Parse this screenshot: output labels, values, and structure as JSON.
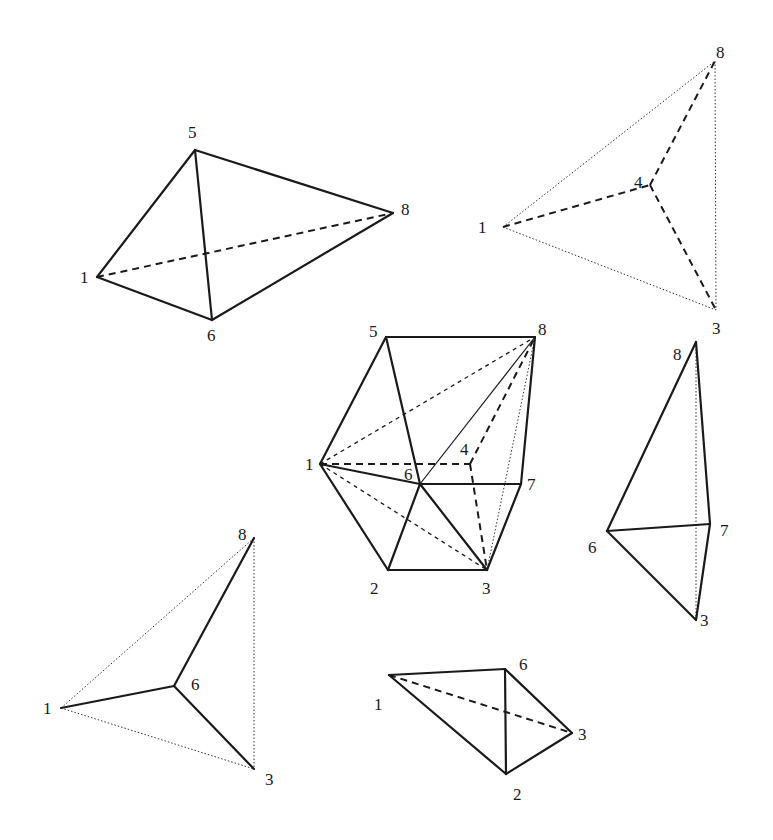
{
  "diagram": {
    "figures": [
      {
        "id": "tetra-1-5-6-8",
        "vertices": {
          "1": [
            97,
            277
          ],
          "5": [
            195,
            150
          ],
          "8": [
            393,
            213
          ],
          "6": [
            212,
            320
          ]
        },
        "labels": {
          "1": [
            80,
            283
          ],
          "5": [
            188,
            138
          ],
          "8": [
            401,
            215
          ],
          "6": [
            207,
            341
          ]
        },
        "solid": [
          [
            "1",
            "5"
          ],
          [
            "5",
            "8"
          ],
          [
            "8",
            "6"
          ],
          [
            "6",
            "1"
          ],
          [
            "5",
            "6"
          ]
        ],
        "dashed": [
          [
            "1",
            "8"
          ]
        ],
        "fdash": [],
        "dotted": [],
        "thin": []
      },
      {
        "id": "tetra-1-3-4-8",
        "vertices": {
          "1": [
            503,
            227
          ],
          "8": [
            715,
            61
          ],
          "4": [
            650,
            185
          ],
          "3": [
            716,
            310
          ]
        },
        "labels": {
          "1": [
            478,
            233
          ],
          "8": [
            716,
            58
          ],
          "4": [
            634,
            188
          ],
          "3": [
            712,
            334
          ]
        },
        "solid": [],
        "dashed": [
          [
            "1",
            "4"
          ],
          [
            "4",
            "8"
          ],
          [
            "4",
            "3"
          ]
        ],
        "fdash": [],
        "dotted": [
          [
            "1",
            "8"
          ],
          [
            "8",
            "3"
          ],
          [
            "1",
            "3"
          ]
        ],
        "thin": []
      },
      {
        "id": "cube",
        "vertices": {
          "1": [
            320,
            464
          ],
          "5": [
            386,
            337
          ],
          "8": [
            535,
            337
          ],
          "4": [
            470,
            464
          ],
          "6": [
            420,
            484
          ],
          "7": [
            521,
            484
          ],
          "2": [
            388,
            570
          ],
          "3": [
            487,
            570
          ]
        },
        "labels": {
          "1": [
            305,
            470
          ],
          "5": [
            369,
            337
          ],
          "8": [
            538,
            335
          ],
          "4": [
            460,
            455
          ],
          "6": [
            404,
            480
          ],
          "7": [
            527,
            490
          ],
          "2": [
            370,
            594
          ],
          "3": [
            482,
            594
          ]
        },
        "solid": [
          [
            "1",
            "5"
          ],
          [
            "5",
            "8"
          ],
          [
            "8",
            "7"
          ],
          [
            "7",
            "3"
          ],
          [
            "3",
            "2"
          ],
          [
            "2",
            "1"
          ],
          [
            "5",
            "6"
          ],
          [
            "1",
            "6"
          ],
          [
            "6",
            "7"
          ],
          [
            "6",
            "2"
          ],
          [
            "6",
            "3"
          ]
        ],
        "thin": [
          [
            "6",
            "8"
          ]
        ],
        "dashed": [
          [
            "1",
            "4"
          ],
          [
            "4",
            "8"
          ],
          [
            "4",
            "3"
          ]
        ],
        "fdash": [
          [
            "1",
            "8"
          ],
          [
            "1",
            "3"
          ]
        ],
        "dotted": [
          [
            "8",
            "3"
          ]
        ]
      },
      {
        "id": "tetra-3-6-7-8",
        "vertices": {
          "8": [
            696,
            342
          ],
          "6": [
            607,
            531
          ],
          "7": [
            710,
            524
          ],
          "3": [
            696,
            620
          ]
        },
        "labels": {
          "8": [
            673,
            360
          ],
          "6": [
            588,
            553
          ],
          "7": [
            720,
            536
          ],
          "3": [
            700,
            626
          ]
        },
        "solid": [
          [
            "8",
            "6"
          ],
          [
            "8",
            "7"
          ],
          [
            "6",
            "7"
          ],
          [
            "6",
            "3"
          ],
          [
            "7",
            "3"
          ]
        ],
        "dashed": [],
        "fdash": [],
        "dotted": [
          [
            "8",
            "3"
          ]
        ],
        "thin": []
      },
      {
        "id": "tetra-1-3-6-8",
        "vertices": {
          "1": [
            61,
            708
          ],
          "8": [
            254,
            538
          ],
          "6": [
            174,
            686
          ],
          "3": [
            254,
            769
          ]
        },
        "labels": {
          "1": [
            43,
            714
          ],
          "8": [
            238,
            540
          ],
          "6": [
            191,
            690
          ],
          "3": [
            265,
            785
          ]
        },
        "solid": [
          [
            "1",
            "6"
          ],
          [
            "6",
            "8"
          ],
          [
            "6",
            "3"
          ]
        ],
        "dashed": [],
        "fdash": [],
        "dotted": [
          [
            "1",
            "8"
          ],
          [
            "8",
            "3"
          ],
          [
            "1",
            "3"
          ]
        ],
        "thin": []
      },
      {
        "id": "tetra-1-2-3-6",
        "vertices": {
          "1": [
            389,
            675
          ],
          "6": [
            505,
            669
          ],
          "3": [
            572,
            733
          ],
          "2": [
            506,
            774
          ]
        },
        "labels": {
          "1": [
            374,
            710
          ],
          "6": [
            519,
            670
          ],
          "3": [
            578,
            740
          ],
          "2": [
            513,
            800
          ]
        },
        "solid": [
          [
            "1",
            "6"
          ],
          [
            "1",
            "2"
          ],
          [
            "6",
            "2"
          ],
          [
            "6",
            "3"
          ],
          [
            "2",
            "3"
          ]
        ],
        "dashed": [
          [
            "1",
            "3"
          ]
        ],
        "fdash": [],
        "dotted": [],
        "thin": []
      }
    ]
  }
}
